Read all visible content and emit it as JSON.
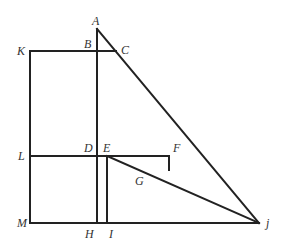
{
  "diagram": {
    "stroke_color": "#222222",
    "label_color": "#333333",
    "points": {
      "A": {
        "x": 97,
        "y": 29
      },
      "B": {
        "x": 97,
        "y": 51
      },
      "C": {
        "x": 116,
        "y": 51
      },
      "K": {
        "x": 30,
        "y": 51
      },
      "L": {
        "x": 30,
        "y": 156
      },
      "D": {
        "x": 97,
        "y": 156
      },
      "E": {
        "x": 107,
        "y": 156
      },
      "F": {
        "x": 169,
        "y": 156
      },
      "G": {
        "x": 169,
        "y": 170
      },
      "M": {
        "x": 30,
        "y": 223
      },
      "H": {
        "x": 97,
        "y": 223
      },
      "I": {
        "x": 107,
        "y": 223
      },
      "j": {
        "x": 259,
        "y": 223
      }
    },
    "labels": {
      "A": "A",
      "B": "B",
      "C": "C",
      "K": "K",
      "L": "L",
      "D": "D",
      "E": "E",
      "F": "F",
      "G": "G",
      "M": "M",
      "H": "H",
      "I": "I",
      "j": "j"
    },
    "segments": [
      [
        "K",
        "C"
      ],
      [
        "K",
        "M"
      ],
      [
        "A",
        "H"
      ],
      [
        "A",
        "j"
      ],
      [
        "L",
        "F"
      ],
      [
        "F",
        "G"
      ],
      [
        "E",
        "j"
      ],
      [
        "E",
        "I"
      ],
      [
        "M",
        "j"
      ]
    ]
  }
}
